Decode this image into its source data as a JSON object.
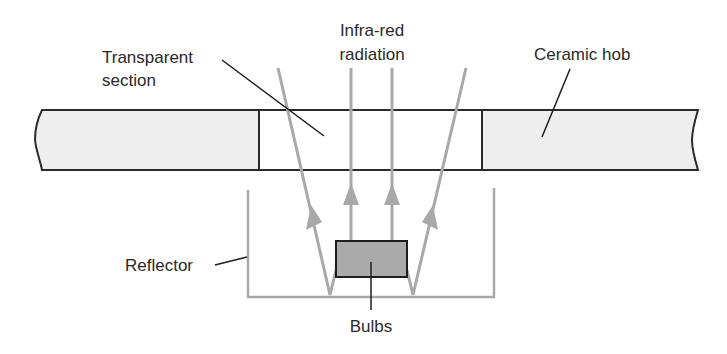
{
  "diagram": {
    "labels": {
      "transparent_section": [
        "Transparent",
        "section"
      ],
      "infra_red": [
        "Infra-red",
        "radiation"
      ],
      "ceramic_hob": "Ceramic hob",
      "reflector": "Reflector",
      "bulbs": "Bulbs"
    },
    "colors": {
      "hob_fill": "#eeeeee",
      "outline": "#2a2a2a",
      "ray": "#a9a9a9",
      "bulb_fill": "#aaaaaa",
      "reflector": "#a9a9a9",
      "background": "#ffffff"
    },
    "components": [
      {
        "id": "ceramic-hob",
        "name": "Ceramic hob"
      },
      {
        "id": "transparent-section",
        "name": "Transparent section"
      },
      {
        "id": "infra-red-rays",
        "name": "Infra-red radiation",
        "count": 4
      },
      {
        "id": "bulbs",
        "name": "Bulbs"
      },
      {
        "id": "reflector",
        "name": "Reflector"
      }
    ]
  }
}
